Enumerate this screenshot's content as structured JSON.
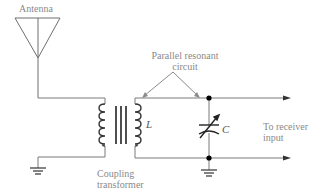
{
  "diagram": {
    "labels": {
      "antenna": "Antenna",
      "parallel_line1": "Parallel resonant",
      "parallel_line2": "circuit",
      "inductor": "L",
      "capacitor": "C",
      "receiver_line1": "To receiver",
      "receiver_line2": "input",
      "coupling_line1": "Coupling",
      "coupling_line2": "transformer"
    },
    "components": [
      {
        "type": "antenna",
        "label": "Antenna"
      },
      {
        "type": "coupling-transformer",
        "label": "Coupling transformer"
      },
      {
        "type": "inductor",
        "label": "L"
      },
      {
        "type": "variable-capacitor",
        "label": "C"
      },
      {
        "type": "ground",
        "count": 2
      },
      {
        "type": "output",
        "label": "To receiver input"
      }
    ],
    "colors": {
      "wire": "#7a7a7a",
      "label": "#8a8a8a",
      "node": "#000000",
      "core": "#222222"
    }
  }
}
